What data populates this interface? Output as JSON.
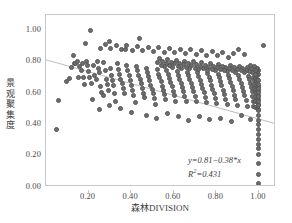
{
  "chart_data": {
    "type": "scatter",
    "title": "",
    "xlabel": "森林DIVISION",
    "ylabel": "景观聚集度",
    "xlim": [
      0.0,
      1.08
    ],
    "ylim": [
      0.0,
      1.1
    ],
    "xticks": [
      "0.20",
      "0.40",
      "0.60",
      "0.80",
      "1.00"
    ],
    "xtick_values": [
      0.2,
      0.4,
      0.6,
      0.8,
      1.0
    ],
    "yticks": [
      "0.00",
      "0.20",
      "0.40",
      "0.60",
      "0.80",
      "1.00"
    ],
    "ytick_values": [
      0.0,
      0.2,
      0.4,
      0.6,
      0.8,
      1.0
    ],
    "grid": false,
    "legend": "none",
    "marker_color": "#6e6e6e",
    "marker_edge_color": "#555555",
    "frame_color": "#c9c9c9",
    "trendline_color": "#b4b4b4",
    "annotations": {
      "equation": "y=0.81−0.38*x",
      "r_squared_label": "R",
      "r_squared_sup": "2",
      "r_squared_value": "=0.431",
      "slope": -0.38,
      "intercept": 0.81,
      "r2": 0.431
    },
    "trendline": {
      "x0": 0.0,
      "y0": 0.81,
      "x1": 1.08,
      "y1": 0.3996
    },
    "points": [
      [
        0.05,
        0.365
      ],
      [
        0.06,
        0.555
      ],
      [
        0.095,
        0.672
      ],
      [
        0.11,
        0.697
      ],
      [
        0.118,
        0.762
      ],
      [
        0.13,
        0.838
      ],
      [
        0.135,
        0.79
      ],
      [
        0.14,
        0.793
      ],
      [
        0.148,
        0.805
      ],
      [
        0.152,
        0.7
      ],
      [
        0.158,
        0.768
      ],
      [
        0.165,
        0.742
      ],
      [
        0.17,
        0.79
      ],
      [
        0.175,
        0.7
      ],
      [
        0.18,
        0.655
      ],
      [
        0.185,
        0.915
      ],
      [
        0.19,
        0.805
      ],
      [
        0.196,
        0.78
      ],
      [
        0.2,
        0.738
      ],
      [
        0.205,
        0.7
      ],
      [
        0.21,
        1.0
      ],
      [
        0.215,
        0.66
      ],
      [
        0.218,
        0.562
      ],
      [
        0.224,
        0.775
      ],
      [
        0.23,
        0.715
      ],
      [
        0.236,
        0.688
      ],
      [
        0.24,
        0.8
      ],
      [
        0.245,
        0.755
      ],
      [
        0.25,
        0.73
      ],
      [
        0.255,
        0.64
      ],
      [
        0.262,
        0.606
      ],
      [
        0.268,
        0.585
      ],
      [
        0.272,
        0.795
      ],
      [
        0.278,
        0.745
      ],
      [
        0.282,
        0.69
      ],
      [
        0.288,
        0.658
      ],
      [
        0.292,
        0.62
      ],
      [
        0.298,
        0.93
      ],
      [
        0.302,
        0.76
      ],
      [
        0.308,
        0.712
      ],
      [
        0.312,
        0.682
      ],
      [
        0.318,
        0.648
      ],
      [
        0.322,
        0.6
      ],
      [
        0.328,
        0.548
      ],
      [
        0.334,
        0.79
      ],
      [
        0.34,
        0.752
      ],
      [
        0.346,
        0.718
      ],
      [
        0.352,
        0.69
      ],
      [
        0.358,
        0.662
      ],
      [
        0.362,
        0.628
      ],
      [
        0.368,
        0.598
      ],
      [
        0.374,
        0.88
      ],
      [
        0.38,
        0.775
      ],
      [
        0.385,
        0.742
      ],
      [
        0.39,
        0.712
      ],
      [
        0.396,
        0.682
      ],
      [
        0.402,
        0.652
      ],
      [
        0.408,
        0.62
      ],
      [
        0.412,
        0.585
      ],
      [
        0.418,
        0.54
      ],
      [
        0.424,
        0.772
      ],
      [
        0.43,
        0.742
      ],
      [
        0.436,
        0.715
      ],
      [
        0.442,
        0.688
      ],
      [
        0.448,
        0.66
      ],
      [
        0.452,
        0.63
      ],
      [
        0.458,
        0.6
      ],
      [
        0.464,
        0.57
      ],
      [
        0.47,
        0.76
      ],
      [
        0.476,
        0.73
      ],
      [
        0.482,
        0.705
      ],
      [
        0.488,
        0.678
      ],
      [
        0.492,
        0.65
      ],
      [
        0.498,
        0.622
      ],
      [
        0.504,
        0.595
      ],
      [
        0.51,
        0.565
      ],
      [
        0.516,
        0.53
      ],
      [
        0.522,
        0.75
      ],
      [
        0.528,
        0.722
      ],
      [
        0.534,
        0.698
      ],
      [
        0.54,
        0.672
      ],
      [
        0.546,
        0.645
      ],
      [
        0.55,
        0.618
      ],
      [
        0.556,
        0.59
      ],
      [
        0.562,
        0.56
      ],
      [
        0.568,
        0.742
      ],
      [
        0.574,
        0.718
      ],
      [
        0.58,
        0.692
      ],
      [
        0.586,
        0.668
      ],
      [
        0.592,
        0.64
      ],
      [
        0.598,
        0.612
      ],
      [
        0.604,
        0.582
      ],
      [
        0.61,
        0.548
      ],
      [
        0.616,
        0.74
      ],
      [
        0.622,
        0.715
      ],
      [
        0.628,
        0.69
      ],
      [
        0.634,
        0.665
      ],
      [
        0.64,
        0.638
      ],
      [
        0.646,
        0.61
      ],
      [
        0.652,
        0.58
      ],
      [
        0.658,
        0.548
      ],
      [
        0.664,
        0.735
      ],
      [
        0.67,
        0.71
      ],
      [
        0.676,
        0.688
      ],
      [
        0.682,
        0.662
      ],
      [
        0.688,
        0.635
      ],
      [
        0.694,
        0.608
      ],
      [
        0.7,
        0.578
      ],
      [
        0.706,
        0.545
      ],
      [
        0.712,
        0.73
      ],
      [
        0.718,
        0.708
      ],
      [
        0.724,
        0.682
      ],
      [
        0.73,
        0.658
      ],
      [
        0.736,
        0.63
      ],
      [
        0.742,
        0.602
      ],
      [
        0.748,
        0.572
      ],
      [
        0.754,
        0.54
      ],
      [
        0.76,
        0.725
      ],
      [
        0.766,
        0.702
      ],
      [
        0.772,
        0.678
      ],
      [
        0.778,
        0.652
      ],
      [
        0.784,
        0.625
      ],
      [
        0.79,
        0.598
      ],
      [
        0.796,
        0.568
      ],
      [
        0.802,
        0.535
      ],
      [
        0.808,
        0.72
      ],
      [
        0.814,
        0.698
      ],
      [
        0.82,
        0.672
      ],
      [
        0.826,
        0.648
      ],
      [
        0.832,
        0.62
      ],
      [
        0.838,
        0.592
      ],
      [
        0.844,
        0.562
      ],
      [
        0.85,
        0.528
      ],
      [
        0.856,
        0.715
      ],
      [
        0.862,
        0.692
      ],
      [
        0.868,
        0.668
      ],
      [
        0.874,
        0.642
      ],
      [
        0.88,
        0.615
      ],
      [
        0.886,
        0.588
      ],
      [
        0.892,
        0.558
      ],
      [
        0.898,
        0.522
      ],
      [
        0.904,
        0.712
      ],
      [
        0.91,
        0.688
      ],
      [
        0.916,
        0.665
      ],
      [
        0.922,
        0.638
      ],
      [
        0.928,
        0.61
      ],
      [
        0.934,
        0.582
      ],
      [
        0.94,
        0.552
      ],
      [
        0.946,
        0.518
      ],
      [
        0.952,
        0.708
      ],
      [
        0.956,
        0.685
      ],
      [
        0.96,
        0.66
      ],
      [
        0.964,
        0.635
      ],
      [
        0.968,
        0.608
      ],
      [
        0.97,
        0.58
      ],
      [
        0.972,
        0.55
      ],
      [
        0.974,
        0.515
      ],
      [
        0.976,
        0.7
      ],
      [
        0.978,
        0.678
      ],
      [
        0.98,
        0.655
      ],
      [
        0.981,
        0.63
      ],
      [
        0.982,
        0.602
      ],
      [
        0.983,
        0.575
      ],
      [
        0.984,
        0.545
      ],
      [
        0.985,
        0.51
      ],
      [
        0.986,
        0.695
      ],
      [
        0.987,
        0.672
      ],
      [
        0.988,
        0.648
      ],
      [
        0.989,
        0.622
      ],
      [
        0.99,
        0.596
      ],
      [
        0.991,
        0.568
      ],
      [
        0.992,
        0.538
      ],
      [
        0.993,
        0.505
      ],
      [
        0.994,
        0.69
      ],
      [
        0.995,
        0.665
      ],
      [
        0.996,
        0.64
      ],
      [
        0.996,
        0.615
      ],
      [
        0.997,
        0.588
      ],
      [
        0.997,
        0.56
      ],
      [
        0.998,
        0.53
      ],
      [
        0.998,
        0.498
      ],
      [
        0.999,
        0.682
      ],
      [
        0.999,
        0.658
      ],
      [
        1.0,
        0.632
      ],
      [
        1.0,
        0.605
      ],
      [
        1.0,
        0.578
      ],
      [
        1.0,
        0.55
      ],
      [
        1.0,
        0.52
      ],
      [
        1.0,
        0.488
      ],
      [
        1.0,
        0.458
      ],
      [
        1.0,
        0.428
      ],
      [
        1.0,
        0.398
      ],
      [
        1.0,
        0.368
      ],
      [
        1.0,
        0.338
      ],
      [
        1.0,
        0.305
      ],
      [
        1.0,
        0.275
      ],
      [
        1.0,
        0.245
      ],
      [
        1.0,
        0.205
      ],
      [
        1.0,
        0.15
      ],
      [
        1.0,
        0.082
      ],
      [
        1.0,
        0.022
      ],
      [
        0.998,
        0.718
      ],
      [
        0.996,
        0.742
      ],
      [
        0.994,
        0.758
      ],
      [
        0.992,
        0.735
      ],
      [
        0.99,
        0.712
      ],
      [
        0.988,
        0.76
      ],
      [
        0.986,
        0.74
      ],
      [
        0.984,
        0.722
      ],
      [
        0.982,
        0.745
      ],
      [
        0.98,
        0.768
      ],
      [
        0.975,
        0.75
      ],
      [
        0.97,
        0.73
      ],
      [
        0.965,
        0.755
      ],
      [
        0.96,
        0.775
      ],
      [
        0.955,
        0.74
      ],
      [
        0.948,
        0.762
      ],
      [
        0.94,
        0.748
      ],
      [
        0.932,
        0.735
      ],
      [
        0.924,
        0.758
      ],
      [
        0.916,
        0.742
      ],
      [
        0.908,
        0.772
      ],
      [
        0.9,
        0.752
      ],
      [
        0.892,
        0.735
      ],
      [
        0.884,
        0.762
      ],
      [
        0.876,
        0.748
      ],
      [
        0.868,
        0.778
      ],
      [
        0.86,
        0.755
      ],
      [
        0.852,
        0.738
      ],
      [
        0.844,
        0.765
      ],
      [
        0.836,
        0.745
      ],
      [
        0.828,
        0.768
      ],
      [
        0.82,
        0.752
      ],
      [
        0.812,
        0.785
      ],
      [
        0.804,
        0.762
      ],
      [
        0.796,
        0.742
      ],
      [
        0.788,
        0.77
      ],
      [
        0.78,
        0.752
      ],
      [
        0.772,
        0.79
      ],
      [
        0.764,
        0.765
      ],
      [
        0.756,
        0.745
      ],
      [
        0.748,
        0.775
      ],
      [
        0.74,
        0.755
      ],
      [
        0.732,
        0.795
      ],
      [
        0.724,
        0.772
      ],
      [
        0.716,
        0.75
      ],
      [
        0.708,
        0.782
      ],
      [
        0.7,
        0.76
      ],
      [
        0.692,
        0.8
      ],
      [
        0.684,
        0.778
      ],
      [
        0.676,
        0.755
      ],
      [
        0.668,
        0.788
      ],
      [
        0.66,
        0.765
      ],
      [
        0.652,
        0.805
      ],
      [
        0.644,
        0.782
      ],
      [
        0.636,
        0.76
      ],
      [
        0.628,
        0.792
      ],
      [
        0.62,
        0.77
      ],
      [
        0.612,
        0.81
      ],
      [
        0.604,
        0.788
      ],
      [
        0.596,
        0.765
      ],
      [
        0.588,
        0.798
      ],
      [
        0.58,
        0.775
      ],
      [
        0.572,
        0.815
      ],
      [
        0.564,
        0.792
      ],
      [
        0.556,
        0.768
      ],
      [
        0.548,
        0.802
      ],
      [
        0.54,
        0.78
      ],
      [
        0.532,
        0.82
      ],
      [
        0.524,
        0.795
      ],
      [
        0.93,
        0.845
      ],
      [
        0.905,
        0.878
      ],
      [
        0.88,
        0.855
      ],
      [
        0.855,
        0.83
      ],
      [
        0.83,
        0.862
      ],
      [
        0.805,
        0.838
      ],
      [
        0.78,
        0.868
      ],
      [
        0.755,
        0.842
      ],
      [
        0.73,
        0.872
      ],
      [
        0.705,
        0.848
      ],
      [
        0.68,
        0.878
      ],
      [
        0.655,
        0.852
      ],
      [
        0.63,
        0.882
      ],
      [
        0.605,
        0.858
      ],
      [
        0.58,
        0.885
      ],
      [
        0.555,
        0.862
      ],
      [
        0.53,
        0.89
      ],
      [
        0.505,
        0.865
      ],
      [
        0.48,
        0.895
      ],
      [
        0.455,
        0.87
      ],
      [
        0.43,
        0.9
      ],
      [
        0.405,
        0.875
      ],
      [
        0.38,
        0.905
      ],
      [
        0.355,
        0.88
      ],
      [
        0.33,
        0.908
      ],
      [
        0.305,
        0.885
      ],
      [
        0.28,
        0.912
      ],
      [
        0.255,
        0.888
      ],
      [
        0.47,
        0.46
      ],
      [
        0.52,
        0.44
      ],
      [
        0.57,
        0.47
      ],
      [
        0.62,
        0.45
      ],
      [
        0.67,
        0.425
      ],
      [
        0.72,
        0.452
      ],
      [
        0.77,
        0.43
      ],
      [
        0.4,
        0.478
      ],
      [
        0.35,
        0.5
      ],
      [
        0.3,
        0.52
      ],
      [
        0.25,
        0.495
      ],
      [
        0.82,
        0.44
      ],
      [
        0.87,
        0.418
      ],
      [
        0.92,
        0.455
      ],
      [
        0.96,
        0.43
      ],
      [
        0.44,
        0.95
      ],
      [
        1.02,
        0.905
      ]
    ]
  }
}
